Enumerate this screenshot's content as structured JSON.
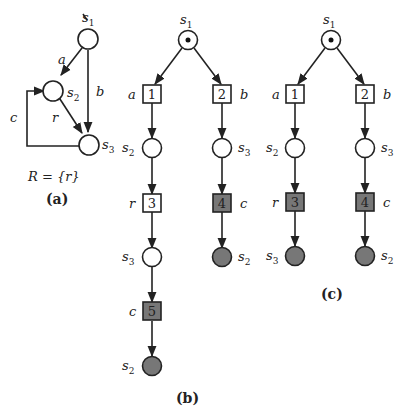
{
  "figure": {
    "panel_a": {
      "caption": "(a)",
      "formula": "R = {r}",
      "states": [
        {
          "id": "s1",
          "label": "s",
          "sub": "1"
        },
        {
          "id": "s2",
          "label": "s",
          "sub": "2"
        },
        {
          "id": "s3",
          "label": "s",
          "sub": "3"
        }
      ],
      "edges": [
        {
          "from": "s1",
          "to": "s2",
          "label": "a"
        },
        {
          "from": "s1",
          "to": "s3",
          "label": "b"
        },
        {
          "from": "s2",
          "to": "s3",
          "label": "r"
        },
        {
          "from": "s3",
          "to": "s2",
          "label": "c"
        }
      ]
    },
    "panel_b": {
      "caption": "(b)",
      "root": {
        "label": "s",
        "sub": "1"
      },
      "events": [
        {
          "num": "1",
          "label": "a",
          "filled": false
        },
        {
          "num": "2",
          "label": "b",
          "filled": false
        },
        {
          "num": "3",
          "label": "r",
          "filled": false
        },
        {
          "num": "4",
          "label": "c",
          "filled": true
        },
        {
          "num": "5",
          "label": "c",
          "filled": true
        }
      ],
      "conditions": [
        {
          "label": "s",
          "sub": "2",
          "filled": false
        },
        {
          "label": "s",
          "sub": "3",
          "filled": false
        },
        {
          "label": "s",
          "sub": "3",
          "filled": false
        },
        {
          "label": "s",
          "sub": "2",
          "filled": true
        },
        {
          "label": "s",
          "sub": "2",
          "filled": true
        }
      ]
    },
    "panel_c": {
      "caption": "(c)",
      "root": {
        "label": "s",
        "sub": "1"
      },
      "events": [
        {
          "num": "1",
          "label": "a",
          "filled": false
        },
        {
          "num": "2",
          "label": "b",
          "filled": false
        },
        {
          "num": "3",
          "label": "r",
          "filled": true
        },
        {
          "num": "4",
          "label": "c",
          "filled": true
        }
      ],
      "conditions": [
        {
          "label": "s",
          "sub": "2",
          "filled": false
        },
        {
          "label": "s",
          "sub": "3",
          "filled": false
        },
        {
          "label": "s",
          "sub": "3",
          "filled": true
        },
        {
          "label": "s",
          "sub": "2",
          "filled": true
        }
      ]
    },
    "colors": {
      "stroke": "#222222",
      "filled": "#777777",
      "empty": "#ffffff"
    }
  }
}
